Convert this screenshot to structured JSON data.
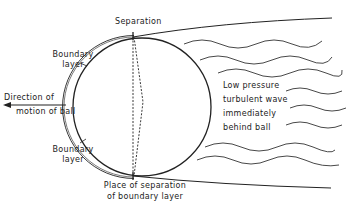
{
  "diagram": {
    "labels": {
      "separation": "Separation",
      "boundary_layer_top_1": "Boundary",
      "boundary_layer_top_2": "layer",
      "boundary_layer_bottom_1": "Boundary",
      "boundary_layer_bottom_2": "layer",
      "direction_1": "Direction of",
      "direction_2": "motion of ball",
      "wake_1": "Low pressure",
      "wake_2": "turbulent wave",
      "wake_3": "immediately",
      "wake_4": "behind ball",
      "place_1": "Place of separation",
      "place_2": "of boundary layer"
    },
    "colors": {
      "stroke": "#222222",
      "background": "#ffffff"
    }
  }
}
